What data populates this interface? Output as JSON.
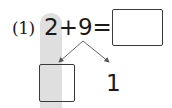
{
  "problem": {
    "number_label": "(1)",
    "expression": "2+9=",
    "answer_box_value": "",
    "decomposition": {
      "left_box_value": "",
      "right_value": "1"
    }
  },
  "colors": {
    "highlight": "#d9d9d9",
    "ink": "#1a1a1a",
    "arrow": "#555555"
  }
}
